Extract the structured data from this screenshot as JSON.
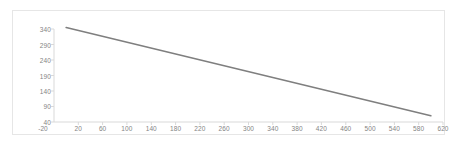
{
  "chart_data": {
    "type": "line",
    "title": "",
    "subtitle": "",
    "xlabel": "",
    "ylabel": "",
    "xlim": [
      -20,
      620
    ],
    "ylim": [
      40,
      340
    ],
    "xticks": [
      -20,
      20,
      60,
      100,
      140,
      180,
      220,
      260,
      300,
      340,
      380,
      420,
      460,
      500,
      540,
      580,
      620
    ],
    "yticks": [
      40,
      90,
      140,
      190,
      240,
      290,
      340
    ],
    "grid": true,
    "legend": null,
    "series": [
      {
        "name": "series-1",
        "color": "#7f7f7f",
        "x": [
          0,
          600
        ],
        "y": [
          345,
          60
        ]
      }
    ]
  },
  "axes": {
    "y_tick_labels": [
      "340",
      "290",
      "240",
      "190",
      "140",
      "90",
      "40"
    ],
    "x_tick_labels": [
      "-20",
      "20",
      "60",
      "100",
      "140",
      "180",
      "220",
      "260",
      "300",
      "340",
      "380",
      "420",
      "460",
      "500",
      "540",
      "580",
      "620"
    ]
  },
  "style": {
    "line_color": "#7f7f7f",
    "axis_color": "#d9d9d9",
    "grid_color": "#ededed",
    "label_color": "#848484",
    "frame_color": "#e6e6e6",
    "background": "#ffffff"
  }
}
